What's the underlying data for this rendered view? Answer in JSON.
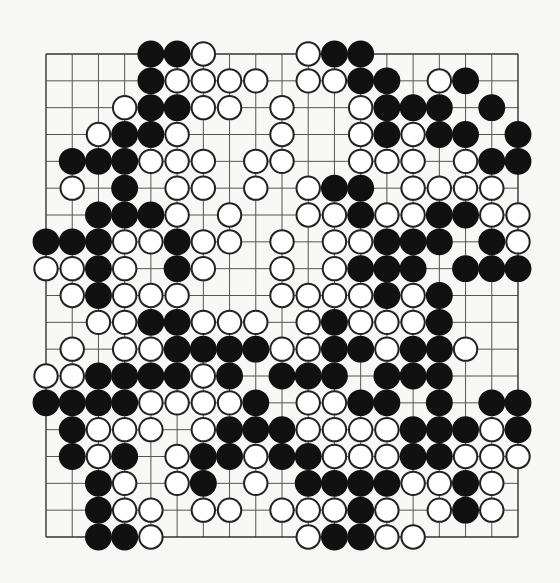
{
  "diagram": {
    "type": "go-board",
    "size": 19,
    "legend": {
      "B": "black stone",
      "W": "white stone",
      ".": "empty"
    },
    "colors": {
      "black": "#111111",
      "white": "#ffffff",
      "line": "#555555",
      "background": "#f7f7f5"
    },
    "rows": [
      "....BBW...WBB......",
      "....BWWWW.WWBB.WB..",
      "...WBBWW.W..WBBB.B.",
      "..WBBW...W..WBWBB.B",
      ".BBBWWW.WW..WWW.WBB",
      ".W.B.WW.W.WBB.WWWW.",
      "..BBBW.W..WWBWWBBWW",
      "BBBWWBWW.W.WWBBB.BW",
      "WWBW.BW..W.WBBB.BBB",
      ".WBWWW...WWWWBWB...",
      "..WWBBWWW.WBWWWB...",
      ".W.WWBBBBWWBBWBBW..",
      "WWBBBBWB.BBB.BBB...",
      "BBBBWWWWB.WWBB.B.BB",
      ".BWWW.WBBBWWWWBBBWB",
      ".BWB.WBBWBBWWWBBWWW",
      "..BW.WB.W.BBBBWWBW.",
      "..BWW.WW.WWWBW.WBW.",
      "..BBW.....WBBWW...."
    ]
  }
}
